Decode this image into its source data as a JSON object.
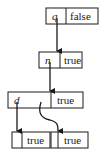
{
  "diagram": {
    "nodes": [
      {
        "id": "top",
        "label": "q",
        "value": "false",
        "x": 46,
        "y": 8,
        "w": 52,
        "h": 16,
        "divider": 66
      },
      {
        "id": "middle",
        "label": "n",
        "value": "true",
        "x": 39,
        "y": 52,
        "w": 43,
        "h": 16,
        "divider": 60
      },
      {
        "id": "third",
        "label": "d",
        "label2": "l",
        "value": "true",
        "x": 8,
        "y": 92,
        "w": 75,
        "h": 16,
        "divider": 51
      },
      {
        "id": "bottom-left",
        "label": "",
        "value": "true",
        "x": 12,
        "y": 132,
        "w": 38,
        "h": 16,
        "divider": 22
      },
      {
        "id": "bottom-right",
        "label": "",
        "value": "true",
        "x": 51,
        "y": 132,
        "w": 37,
        "h": 16,
        "divider": 58
      }
    ],
    "edges": [
      {
        "from": "top",
        "to": "middle"
      },
      {
        "from": "middle",
        "to": "third"
      },
      {
        "from": "third",
        "to": "bottom-left"
      },
      {
        "from": "third",
        "to": "bottom-right"
      }
    ]
  }
}
